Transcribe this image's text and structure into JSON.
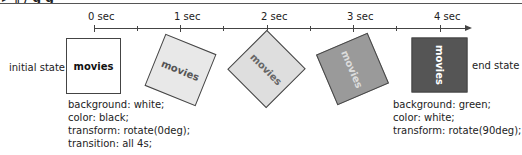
{
  "header_fragment": "▸  ¶ / g                                    g",
  "timeline": {
    "ticks": [
      {
        "label": "0 sec",
        "x": 94
      },
      {
        "label": "1 sec",
        "x": 180
      },
      {
        "label": "2 sec",
        "x": 267
      },
      {
        "label": "3 sec",
        "x": 353
      },
      {
        "label": "4 sec",
        "x": 440
      }
    ],
    "minor_ticks_x": [
      137,
      223,
      310,
      396
    ]
  },
  "boxes": [
    {
      "text": "movies",
      "bg": "#ffffff",
      "color": "#111111",
      "rotate": 0
    },
    {
      "text": "movies",
      "bg": "#e8e8e8",
      "color": "#555555",
      "rotate": 22
    },
    {
      "text": "movies",
      "bg": "#dddddd",
      "color": "#666666",
      "rotate": 45
    },
    {
      "text": "movies",
      "bg": "#9a9a9a",
      "color": "#dddddd",
      "rotate": 67
    },
    {
      "text": "movies",
      "bg": "#555555",
      "color": "#ffffff",
      "rotate": 90
    }
  ],
  "labels": {
    "initial": "initial state",
    "end": "end state"
  },
  "initial_css": [
    "background: white;",
    "color: black;",
    "transform: rotate(0deg);",
    "transition: all 4s;"
  ],
  "end_css": [
    "background: green;",
    "color: white;",
    "transform: rotate(90deg);"
  ]
}
